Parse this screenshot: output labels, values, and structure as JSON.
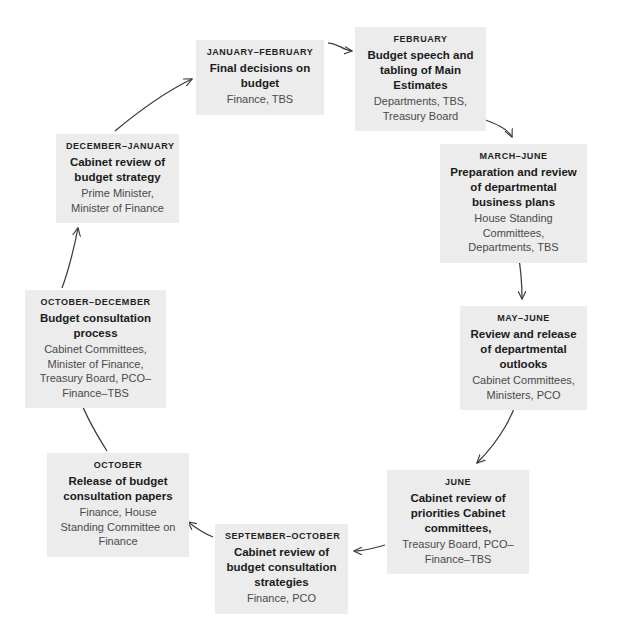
{
  "diagram": {
    "box_fill": "#ececec",
    "arrow_color": "#3c3c3c",
    "nodes": [
      {
        "id": "jan-feb",
        "period": "JANUARY–FEBRUARY",
        "title": "Final decisions on budget",
        "actors": "Finance, TBS"
      },
      {
        "id": "feb",
        "period": "FEBRUARY",
        "title": "Budget speech and tabling of Main Estimates",
        "actors": "Departments, TBS, Treasury Board"
      },
      {
        "id": "mar-jun",
        "period": "MARCH–JUNE",
        "title": "Preparation and review of departmental business plans",
        "actors": "House Standing Committees, Departments, TBS"
      },
      {
        "id": "may-jun",
        "period": "MAY–JUNE",
        "title": "Review and release of departmental outlooks",
        "actors": "Cabinet Committees, Ministers, PCO"
      },
      {
        "id": "jun",
        "period": "JUNE",
        "title": "Cabinet review of priorities Cabinet committees,",
        "actors": "Treasury Board, PCO–Finance–TBS"
      },
      {
        "id": "sep-oct",
        "period": "SEPTEMBER–OCTOBER",
        "title": "Cabinet review of budget consultation strategies",
        "actors": "Finance, PCO"
      },
      {
        "id": "oct",
        "period": "OCTOBER",
        "title": "Release of budget consultation papers",
        "actors": "Finance, House Standing Committee on Finance"
      },
      {
        "id": "oct-dec",
        "period": "OCTOBER–DECEMBER",
        "title": "Budget consultation process",
        "actors": "Cabinet Committees, Minister of Finance, Treasury Board, PCO–Finance–TBS"
      },
      {
        "id": "dec-jan",
        "period": "DECEMBER–JANUARY",
        "title": "Cabinet review of budget strategy",
        "actors": "Prime Minister, Minister of Finance"
      }
    ],
    "flow": [
      "jan-feb → feb",
      "feb → mar-jun",
      "mar-jun → may-jun",
      "may-jun → jun",
      "jun → sep-oct",
      "sep-oct → oct",
      "oct → oct-dec",
      "oct-dec → dec-jan",
      "dec-jan → jan-feb"
    ]
  }
}
